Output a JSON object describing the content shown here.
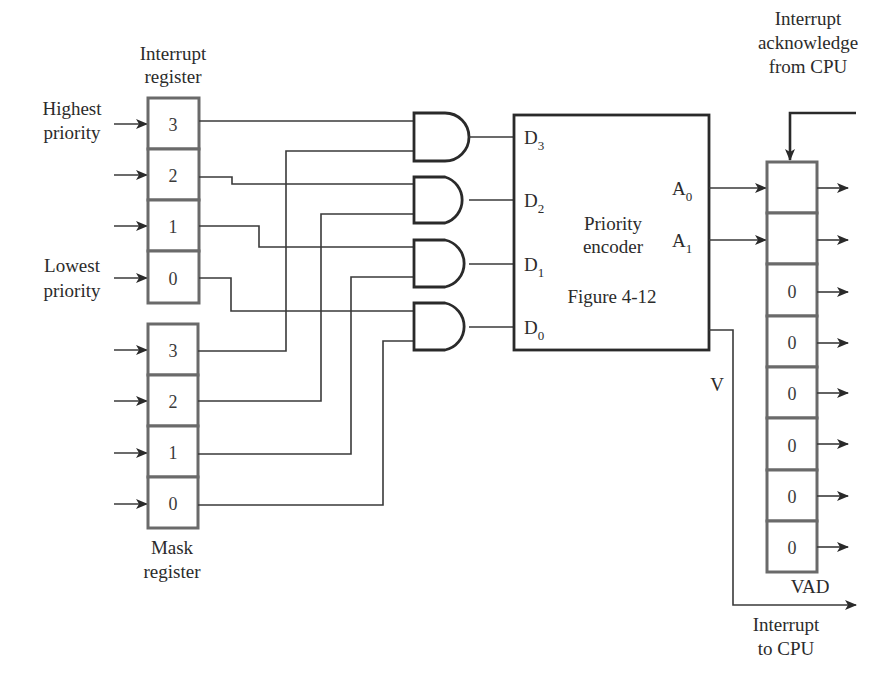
{
  "labels": {
    "interrupt_register": [
      "Interrupt",
      "register"
    ],
    "mask_register": [
      "Mask",
      "register"
    ],
    "highest_priority": [
      "Highest",
      "priority"
    ],
    "lowest_priority": [
      "Lowest",
      "priority"
    ],
    "interrupt_ack": [
      "Interrupt",
      "acknowledge",
      "from CPU"
    ],
    "interrupt_to_cpu": [
      "Interrupt",
      "to CPU"
    ],
    "vad": "VAD",
    "v_signal": "V"
  },
  "interrupt_register": {
    "cells": [
      "3",
      "2",
      "1",
      "0"
    ]
  },
  "mask_register": {
    "cells": [
      "3",
      "2",
      "1",
      "0"
    ]
  },
  "encoder": {
    "title": [
      "Priority",
      "encoder"
    ],
    "figure_ref": "Figure 4-12",
    "inputs": [
      {
        "base": "D",
        "sub": "3"
      },
      {
        "base": "D",
        "sub": "2"
      },
      {
        "base": "D",
        "sub": "1"
      },
      {
        "base": "D",
        "sub": "0"
      }
    ],
    "outputs": [
      {
        "base": "A",
        "sub": "0"
      },
      {
        "base": "A",
        "sub": "1"
      }
    ]
  },
  "vad_register": {
    "cells": [
      "",
      "",
      "0",
      "0",
      "0",
      "0",
      "0",
      "0"
    ]
  },
  "and_gates": [
    {
      "id": "gate-3",
      "input_a": "interrupt-3",
      "input_b": "mask-3",
      "output": "D3"
    },
    {
      "id": "gate-2",
      "input_a": "interrupt-2",
      "input_b": "mask-2",
      "output": "D2"
    },
    {
      "id": "gate-1",
      "input_a": "interrupt-1",
      "input_b": "mask-1",
      "output": "D1"
    },
    {
      "id": "gate-0",
      "input_a": "interrupt-0",
      "input_b": "mask-0",
      "output": "D0"
    }
  ]
}
